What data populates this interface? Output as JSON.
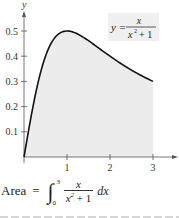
{
  "chart_data": {
    "type": "area",
    "title": "",
    "function_label": {
      "lhs": "y =",
      "numerator": "x",
      "denominator_base": "x",
      "denominator_exp": "2",
      "denominator_rest": "+ 1"
    },
    "xlabel": "",
    "ylabel": "y",
    "xlim": [
      0,
      3.5
    ],
    "ylim": [
      0,
      0.55
    ],
    "x_ticks": [
      1,
      2,
      3
    ],
    "x_tick_labels": [
      "1",
      "2",
      "3"
    ],
    "y_ticks": [
      0.1,
      0.2,
      0.3,
      0.4,
      0.5
    ],
    "y_tick_labels": [
      "0.1",
      "0.2",
      "0.3",
      "0.4",
      "0.5"
    ],
    "shaded_region": {
      "from": 0,
      "to": 3
    },
    "grid": false,
    "x": [
      0,
      0.25,
      0.5,
      0.75,
      1,
      1.25,
      1.5,
      1.75,
      2,
      2.25,
      2.5,
      2.75,
      3
    ],
    "values": [
      0,
      0.235,
      0.4,
      0.48,
      0.5,
      0.488,
      0.462,
      0.431,
      0.4,
      0.371,
      0.345,
      0.322,
      0.3
    ],
    "colors": {
      "curve": "#111111",
      "fill": "#ececec",
      "axis": "#555555",
      "label_bg": "#f0f0f0"
    }
  },
  "formula": {
    "label": "Area",
    "equals": "=",
    "upper_limit": "3",
    "lower_limit": "0",
    "numerator": "x",
    "denominator": "x",
    "denominator_exp": "2",
    "denominator_rest": " + 1",
    "differential": "dx"
  }
}
